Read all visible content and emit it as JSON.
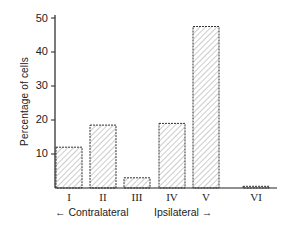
{
  "chart_data": {
    "type": "bar",
    "title": "",
    "xlabel": "",
    "ylabel": "Percentage of cells",
    "categories": [
      "I",
      "II",
      "III",
      "IV",
      "V",
      "VI"
    ],
    "values": [
      12,
      18.5,
      3,
      19,
      47.5,
      0.5
    ],
    "ylim": [
      0,
      50
    ],
    "yticks": [
      10,
      20,
      30,
      40,
      50
    ],
    "grid": false,
    "legend": null,
    "bar_style": "diagonal hatch, dashed outline",
    "annotations": [
      {
        "text": "← Contralateral",
        "position": "below categories I–III"
      },
      {
        "text": "Ipsilateral →",
        "position": "below categories IV–V"
      }
    ]
  },
  "axis": {
    "ylabel": "Percentage of cells",
    "yticks": [
      "10",
      "20",
      "30",
      "40",
      "50"
    ],
    "xticks": [
      "I",
      "II",
      "III",
      "IV",
      "V",
      "VI"
    ]
  },
  "annotations": {
    "contralateral": "← Contralateral",
    "ipsilateral": "Ipsilateral →"
  }
}
